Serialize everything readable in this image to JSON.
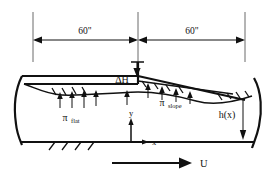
{
  "figure": {
    "kind": "engineering-cross-section-diagram",
    "background_color": "#ffffff",
    "line_color": "#111111",
    "extension_line_color": "#6a6a6a",
    "width_px": 278,
    "height_px": 178
  },
  "dimensions": {
    "left_span_label": "60\"",
    "right_span_label": "60\"",
    "unit_note": "inches"
  },
  "labels": {
    "delta_h": "ΔH",
    "pi_flat_symbol": "π",
    "pi_flat_subscript": "flat",
    "pi_slope_symbol": "π",
    "pi_slope_subscript": "slope",
    "height_function": "h(x)",
    "axis_y": "y",
    "axis_x": "x",
    "velocity": "U"
  },
  "geometry": {
    "top_dim_y": 40,
    "extension_x_left": 33,
    "extension_x_mid": 138,
    "extension_x_right": 245,
    "flat_plate_y": 84,
    "slope_start_y": 80,
    "slope_end_y": 97,
    "bottom_wall_y": 142,
    "step_x": 138,
    "origin_x": 131,
    "origin_y": 142
  },
  "pressure_arrows": {
    "flat_count": 5,
    "slope_count": 4,
    "note": "upward arrows indicating distributed pressure"
  }
}
